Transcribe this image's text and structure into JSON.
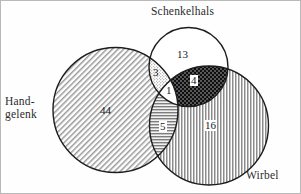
{
  "diagram": {
    "type": "venn",
    "sets": [
      {
        "id": "handgelenk",
        "label": "Hand-\ngelenk",
        "label_line1": "Hand-",
        "label_line2": "gelenk",
        "fill": "diagonal-hatch",
        "color": "#8a8a8a"
      },
      {
        "id": "schenkelhals",
        "label": "Schenkelhals",
        "fill": "none",
        "color": "#ffffff"
      },
      {
        "id": "wirbel",
        "label": "Wirbel",
        "fill": "vertical-stripes",
        "color": "#8f8f8f"
      }
    ],
    "regions": [
      {
        "id": "handgelenk-only",
        "sets": [
          "handgelenk"
        ],
        "value": "44",
        "fill": "diagonal-hatch"
      },
      {
        "id": "schenkelhals-only",
        "sets": [
          "schenkelhals"
        ],
        "value": "13",
        "fill": "none"
      },
      {
        "id": "wirbel-only",
        "sets": [
          "wirbel"
        ],
        "value": "16",
        "fill": "vertical-stripes"
      },
      {
        "id": "handgelenk-schenkelhals",
        "sets": [
          "handgelenk",
          "schenkelhals"
        ],
        "value": "3",
        "fill": "stipple"
      },
      {
        "id": "handgelenk-wirbel",
        "sets": [
          "handgelenk",
          "wirbel"
        ],
        "value": "5",
        "fill": "horizontal-lines"
      },
      {
        "id": "schenkelhals-wirbel",
        "sets": [
          "schenkelhals",
          "wirbel"
        ],
        "value": "4",
        "fill": "dark-crosshatch"
      },
      {
        "id": "all-three",
        "sets": [
          "handgelenk",
          "schenkelhals",
          "wirbel"
        ],
        "value": "1",
        "fill": "none"
      }
    ],
    "stroke_color": "#1d1d1d",
    "text_color": "#1a1a1a",
    "background": "#fefefe",
    "border_color": "#b9b9b9"
  }
}
